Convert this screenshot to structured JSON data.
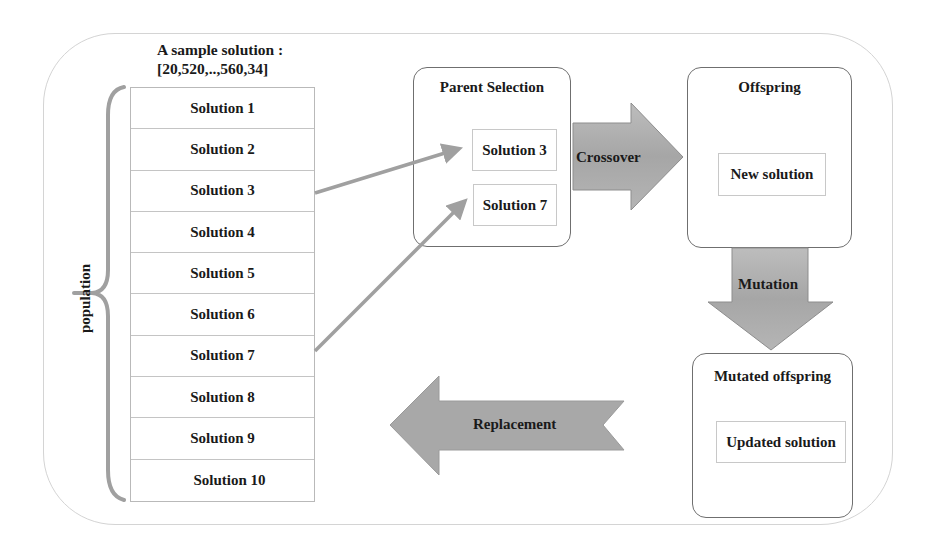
{
  "sample": {
    "title_line1": "A sample solution :",
    "title_line2": "[20,520,..,560,34]"
  },
  "population": {
    "label": "population",
    "solutions": [
      "Solution 1",
      "Solution 2",
      "Solution 3",
      "Solution 4",
      "Solution 5",
      "Solution 6",
      "Solution 7",
      "Solution 8",
      "Solution 9",
      "Solution 10"
    ]
  },
  "parent_selection": {
    "title": "Parent Selection",
    "selected": [
      "Solution 3",
      "Solution 7"
    ]
  },
  "offspring": {
    "title": "Offspring",
    "item": "New solution"
  },
  "mutated_offspring": {
    "title": "Mutated offspring",
    "item": "Updated solution"
  },
  "operations": {
    "crossover": "Crossover",
    "mutation": "Mutation",
    "replacement": "Replacement"
  },
  "colors": {
    "arrow_fill": "#a8a8a8",
    "connector": "#a0a0a0",
    "box_border": "#6f6f6f",
    "outer_border": "#d4d4d4"
  }
}
